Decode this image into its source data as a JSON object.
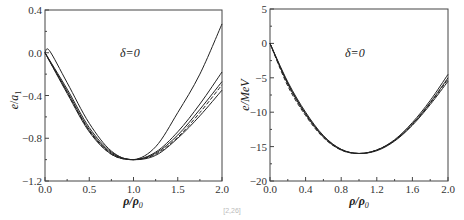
{
  "chart_data": [
    {
      "type": "line",
      "panel": "left",
      "title": "",
      "annotation": "δ=0",
      "xlabel": "ρ/ρ0",
      "ylabel": "e/a1",
      "xlim": [
        0.0,
        2.0
      ],
      "ylim": [
        -1.2,
        0.4
      ],
      "xticks": [
        "0.0",
        "0.5",
        "1.0",
        "1.5",
        "2.0"
      ],
      "yticks": [
        "0.4",
        "0.0",
        "-0.4",
        "-0.8",
        "-1.2"
      ],
      "grid": false,
      "legend": null,
      "series": [
        {
          "name": "curve1",
          "style": "solid",
          "x": [
            0.0,
            0.05,
            0.25,
            0.5,
            0.75,
            1.0,
            1.25,
            1.5,
            1.75,
            2.0
          ],
          "y": [
            0.0,
            0.02,
            -0.28,
            -0.66,
            -0.92,
            -1.0,
            -0.88,
            -0.56,
            -0.2,
            0.27
          ]
        },
        {
          "name": "curve2",
          "style": "solid",
          "x": [
            0.0,
            0.25,
            0.5,
            0.75,
            1.0,
            1.25,
            1.5,
            1.75,
            2.0
          ],
          "y": [
            0.0,
            -0.34,
            -0.7,
            -0.93,
            -1.0,
            -0.93,
            -0.74,
            -0.48,
            -0.18
          ]
        },
        {
          "name": "curve3",
          "style": "solid",
          "x": [
            0.0,
            0.25,
            0.5,
            0.75,
            1.0,
            1.25,
            1.5,
            1.75,
            2.0
          ],
          "y": [
            0.0,
            -0.36,
            -0.72,
            -0.94,
            -1.0,
            -0.94,
            -0.77,
            -0.53,
            -0.27
          ]
        },
        {
          "name": "curve4",
          "style": "dashed",
          "x": [
            0.0,
            0.25,
            0.5,
            0.75,
            1.0,
            1.25,
            1.5,
            1.75,
            2.0
          ],
          "y": [
            0.0,
            -0.37,
            -0.73,
            -0.95,
            -1.0,
            -0.95,
            -0.79,
            -0.56,
            -0.3
          ]
        },
        {
          "name": "curve5",
          "style": "solid",
          "x": [
            0.0,
            0.25,
            0.5,
            0.75,
            1.0,
            1.25,
            1.5,
            1.75,
            2.0
          ],
          "y": [
            0.0,
            -0.38,
            -0.74,
            -0.95,
            -1.0,
            -0.96,
            -0.8,
            -0.59,
            -0.35
          ]
        }
      ]
    },
    {
      "type": "line",
      "panel": "right",
      "title": "",
      "annotation": "δ=0",
      "xlabel": "ρ/ρ0",
      "ylabel": "e/MeV",
      "xlim": [
        0.0,
        2.0
      ],
      "ylim": [
        -20,
        5
      ],
      "xticks": [
        "0.0",
        "0.4",
        "0.8",
        "1.2",
        "1.6",
        "2.0"
      ],
      "yticks": [
        "5",
        "0",
        "-5",
        "-10",
        "-15",
        "-20"
      ],
      "grid": false,
      "legend": null,
      "series": [
        {
          "name": "curve1",
          "style": "solid",
          "x": [
            0.0,
            0.2,
            0.4,
            0.6,
            0.8,
            1.0,
            1.2,
            1.4,
            1.6,
            1.8,
            2.0
          ],
          "y": [
            0.0,
            -5.6,
            -10.0,
            -13.4,
            -15.4,
            -16.0,
            -15.5,
            -14.0,
            -11.5,
            -8.3,
            -4.5
          ]
        },
        {
          "name": "curve2",
          "style": "solid",
          "x": [
            0.0,
            0.2,
            0.4,
            0.6,
            0.8,
            1.0,
            1.2,
            1.4,
            1.6,
            1.8,
            2.0
          ],
          "y": [
            0.0,
            -5.8,
            -10.2,
            -13.5,
            -15.4,
            -16.0,
            -15.5,
            -14.1,
            -11.7,
            -8.6,
            -5.0
          ]
        },
        {
          "name": "curve3",
          "style": "solid",
          "x": [
            0.0,
            0.2,
            0.4,
            0.6,
            0.8,
            1.0,
            1.2,
            1.4,
            1.6,
            1.8,
            2.0
          ],
          "y": [
            0.0,
            -5.9,
            -10.3,
            -13.6,
            -15.5,
            -16.0,
            -15.6,
            -14.2,
            -11.9,
            -8.9,
            -5.5
          ]
        },
        {
          "name": "curve4",
          "style": "dashed",
          "x": [
            0.0,
            0.2,
            0.4,
            0.6,
            0.8,
            1.0,
            1.2,
            1.4,
            1.6,
            1.8,
            2.0
          ],
          "y": [
            0.0,
            -6.2,
            -10.5,
            -13.7,
            -15.5,
            -16.0,
            -15.5,
            -14.1,
            -11.8,
            -8.7,
            -5.2
          ]
        }
      ]
    }
  ],
  "panels": {
    "left": {
      "annotation": "δ=0",
      "ylabel_main": "e",
      "ylabel_sub": "a",
      "ylabel_subsub": "1",
      "xlabel_main": "ρ/ρ",
      "xlabel_sub": "0",
      "xticks": [
        "0.0",
        "0.5",
        "1.0",
        "1.5",
        "2.0"
      ],
      "yticks": [
        "0.4",
        "0.0",
        "-0.4",
        "-0.8",
        "-1.2"
      ]
    },
    "right": {
      "annotation": "δ=0",
      "ylabel": "e/MeV",
      "xlabel_main": "ρ/ρ",
      "xlabel_sub": "0",
      "xticks": [
        "0.0",
        "0.4",
        "0.8",
        "1.2",
        "1.6",
        "2.0"
      ],
      "yticks": [
        "5",
        "0",
        "-5",
        "-10",
        "-15",
        "-20"
      ]
    }
  },
  "caption": "[2,26]"
}
